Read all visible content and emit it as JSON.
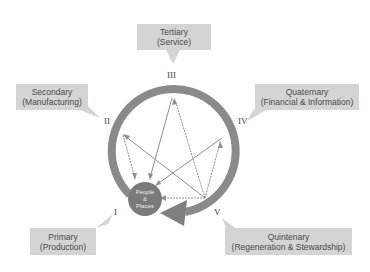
{
  "diagram": {
    "center": {
      "line1": "People",
      "line2": "&",
      "line3": "Places"
    },
    "sectors": [
      {
        "numeral": "I",
        "title": "Primary",
        "subtitle": "(Production)"
      },
      {
        "numeral": "II",
        "title": "Secondary",
        "subtitle": "(Manufacturing)"
      },
      {
        "numeral": "III",
        "title": "Tertiary",
        "subtitle": "(Service)"
      },
      {
        "numeral": "IV",
        "title": "Quaternary",
        "subtitle": "(Financial & Information)"
      },
      {
        "numeral": "V",
        "title": "Quintenary",
        "subtitle": "(Regeneration & Stewardship)"
      }
    ],
    "colors": {
      "ring": "#8a8a8a",
      "box": "#d4d4d4",
      "center": "#7a7a7a",
      "arrows": "#888888"
    }
  }
}
